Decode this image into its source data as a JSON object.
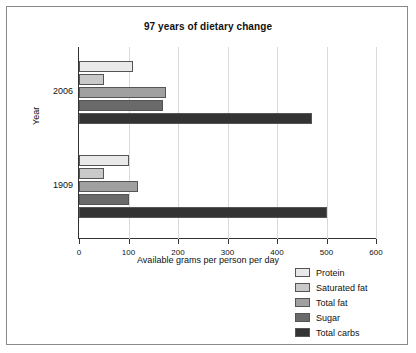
{
  "chart_data": {
    "type": "bar",
    "orientation": "horizontal",
    "title": "97 years of dietary change",
    "xlabel": "Available grams per person per day",
    "ylabel": "Year",
    "categories": [
      "2006",
      "1909"
    ],
    "xlim": [
      0,
      600
    ],
    "xticks": [
      0,
      100,
      200,
      300,
      400,
      500,
      600
    ],
    "grid": true,
    "legend_position": "bottom-right",
    "series": [
      {
        "name": "Protein",
        "color": "#e9e9e9",
        "values": [
          110,
          100
        ]
      },
      {
        "name": "Saturated fat",
        "color": "#c9c9c9",
        "values": [
          50,
          50
        ]
      },
      {
        "name": "Total fat",
        "color": "#a0a0a0",
        "values": [
          175,
          120
        ]
      },
      {
        "name": "Sugar",
        "color": "#6a6a6a",
        "values": [
          170,
          100
        ]
      },
      {
        "name": "Total carbs",
        "color": "#333333",
        "values": [
          470,
          500
        ]
      }
    ]
  }
}
